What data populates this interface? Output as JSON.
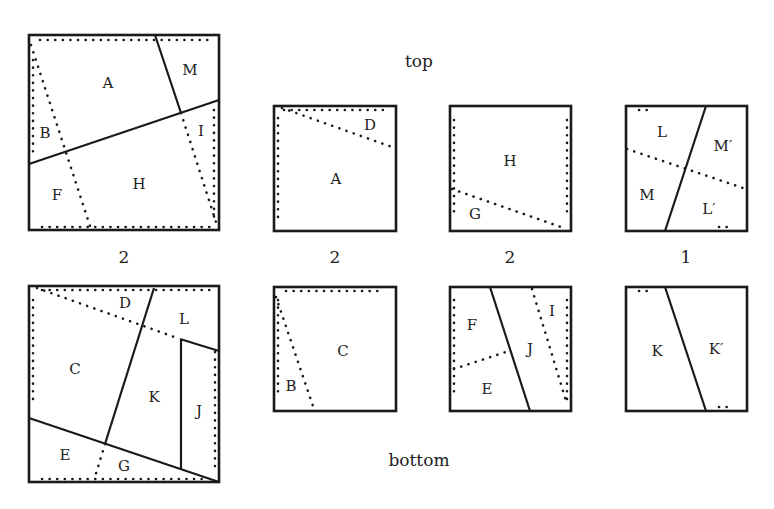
{
  "headings": {
    "top": "top",
    "bottom": "bottom"
  },
  "multiplicities": [
    "2",
    "2",
    "2",
    "1"
  ],
  "big_top": {
    "labels": {
      "A": "A",
      "M": "M",
      "B": "B",
      "I": "I",
      "F": "F",
      "H": "H"
    }
  },
  "big_bottom": {
    "labels": {
      "D": "D",
      "L": "L",
      "C": "C",
      "K": "K",
      "J": "J",
      "E": "E",
      "G": "G"
    }
  },
  "small_top": [
    {
      "labels": [
        "D",
        "A"
      ]
    },
    {
      "labels": [
        "H",
        "G"
      ]
    },
    {
      "labels": [
        "L",
        "M′",
        "M",
        "L′"
      ]
    }
  ],
  "small_bottom": [
    {
      "labels": [
        "C",
        "B"
      ]
    },
    {
      "labels": [
        "F",
        "I",
        "J",
        "E"
      ]
    },
    {
      "labels": [
        "K",
        "K′"
      ]
    }
  ]
}
